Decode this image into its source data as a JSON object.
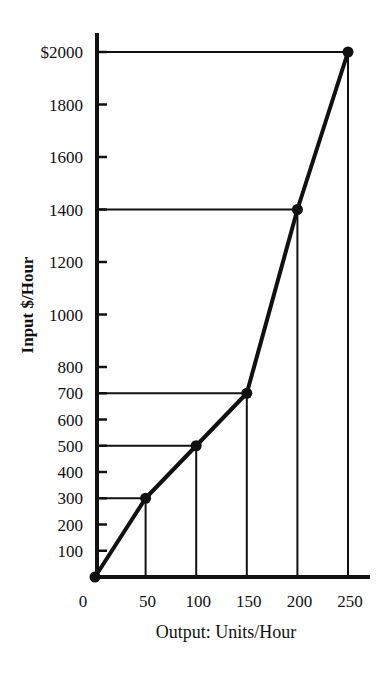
{
  "chart_data": {
    "type": "line",
    "title": "",
    "xlabel": "Output: Units/Hour",
    "ylabel": "Input $/Hour",
    "x": [
      0,
      50,
      100,
      150,
      200,
      250
    ],
    "series": [
      {
        "name": "Input vs Output",
        "values": [
          0,
          300,
          500,
          700,
          1400,
          2000
        ],
        "markers": true
      }
    ],
    "x_ticks": [
      "0",
      "50",
      "100",
      "150",
      "200",
      "250"
    ],
    "y_ticks": [
      {
        "value": 2000,
        "label": "$2000"
      },
      {
        "value": 1800,
        "label": "1800"
      },
      {
        "value": 1600,
        "label": "1600"
      },
      {
        "value": 1400,
        "label": "1400"
      },
      {
        "value": 1200,
        "label": "1200"
      },
      {
        "value": 1000,
        "label": "1000"
      },
      {
        "value": 800,
        "label": "800"
      },
      {
        "value": 700,
        "label": "700"
      },
      {
        "value": 600,
        "label": "600"
      },
      {
        "value": 500,
        "label": "500"
      },
      {
        "value": 400,
        "label": "400"
      },
      {
        "value": 300,
        "label": "300"
      },
      {
        "value": 200,
        "label": "200"
      },
      {
        "value": 100,
        "label": "100"
      }
    ],
    "xlim": [
      0,
      270
    ],
    "ylim": [
      0,
      2150
    ],
    "grid": false,
    "legend": "none",
    "drop_lines": "Horizontal lines from y-axis and vertical lines from x-axis to each data point"
  },
  "colors": {
    "ink": "#111111",
    "background": "#ffffff"
  }
}
